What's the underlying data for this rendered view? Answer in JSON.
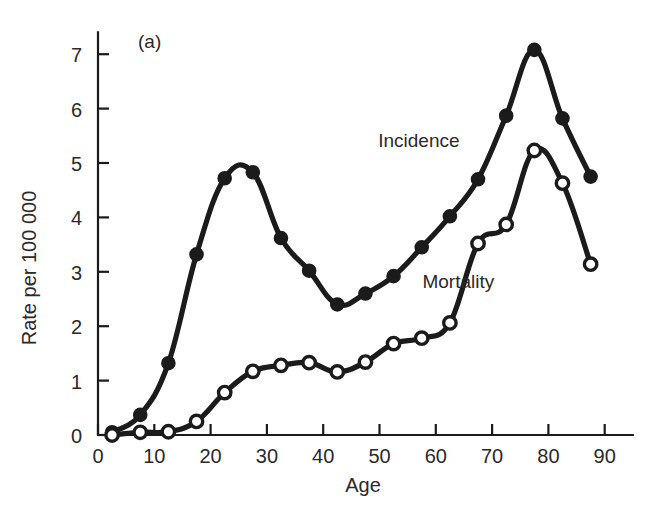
{
  "figure": {
    "panel_label": "(a)",
    "background_color": "#ffffff",
    "ink_color": "#1b1b1b"
  },
  "chart_data": {
    "type": "line",
    "title": "",
    "subtitle": "",
    "panel": "(a)",
    "xlabel": "Age",
    "ylabel": "Rate per 100 000",
    "xlim": [
      0,
      95
    ],
    "ylim": [
      0,
      7.4
    ],
    "xticks": [
      0,
      10,
      20,
      30,
      40,
      50,
      60,
      70,
      80,
      90
    ],
    "xtick_labels": [
      "0",
      "10",
      "20",
      "30",
      "40",
      "50",
      "60",
      "70",
      "80",
      "90"
    ],
    "yticks": [
      0,
      1,
      2,
      3,
      4,
      5,
      6,
      7
    ],
    "ytick_labels": [
      "0",
      "1",
      "2",
      "3",
      "4",
      "5",
      "6",
      "7"
    ],
    "grid": false,
    "legend_position": "inline-annotation",
    "series": [
      {
        "name": "Incidence",
        "marker": "filled-circle",
        "label_position": {
          "x": 57,
          "y": 5.3
        },
        "x": [
          2.5,
          7.5,
          12.5,
          17.5,
          22.5,
          27.5,
          32.5,
          37.5,
          42.5,
          47.5,
          52.5,
          57.5,
          62.5,
          67.5,
          72.5,
          77.5,
          82.5,
          87.5
        ],
        "values": [
          0.05,
          0.37,
          1.32,
          3.32,
          4.72,
          4.83,
          3.62,
          3.02,
          2.4,
          2.6,
          2.92,
          3.45,
          4.02,
          4.7,
          5.87,
          7.08,
          5.82,
          4.75
        ]
      },
      {
        "name": "Mortality",
        "marker": "open-circle",
        "label_position": {
          "x": 64,
          "y": 2.7
        },
        "x": [
          2.5,
          7.5,
          12.5,
          17.5,
          22.5,
          27.5,
          32.5,
          37.5,
          42.5,
          47.5,
          52.5,
          57.5,
          62.5,
          67.5,
          72.5,
          77.5,
          82.5,
          87.5
        ],
        "values": [
          0.0,
          0.05,
          0.06,
          0.25,
          0.78,
          1.17,
          1.28,
          1.33,
          1.16,
          1.34,
          1.68,
          1.78,
          2.06,
          3.52,
          3.87,
          5.23,
          4.63,
          3.14
        ]
      }
    ]
  }
}
